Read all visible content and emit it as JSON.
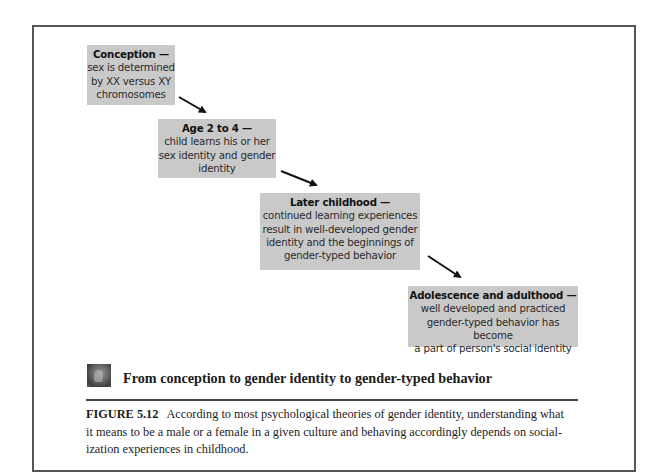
{
  "diagram": {
    "title": "From conception to gender identity to gender-typed behavior",
    "stages": [
      {
        "heading": "Conception —",
        "body_lines": [
          "sex is determined",
          "by XX versus XY",
          "chromosomes"
        ]
      },
      {
        "heading": "Age 2 to 4 —",
        "body_lines": [
          "child learns his or her",
          "sex identity and gender",
          "identity"
        ]
      },
      {
        "heading": "Later childhood —",
        "body_lines": [
          "continued learning experiences",
          "result in well-developed gender",
          "identity and the beginnings of",
          "gender-typed behavior"
        ]
      },
      {
        "heading": "Adolescence and adulthood —",
        "body_lines": [
          "well developed and practiced",
          "gender-typed behavior has become",
          "a part of person's social identity"
        ]
      }
    ],
    "arrows": [
      {
        "from": "Conception",
        "to": "Age 2 to 4"
      },
      {
        "from": "Age 2 to 4",
        "to": "Later childhood"
      },
      {
        "from": "Later childhood",
        "to": "Adolescence and adulthood"
      }
    ],
    "icon": "photo-thumbnail-icon",
    "colors": {
      "box_fill": "#c9c9c9",
      "frame_border": "#555555",
      "arrow": "#111111"
    }
  },
  "caption": {
    "label": "FIGURE 5.12",
    "lines": [
      "According to most psychological theories of gender identity, understanding what",
      "it means to be a male or a female in a given culture and behaving accordingly depends on social-",
      "ization experiences in childhood."
    ]
  }
}
